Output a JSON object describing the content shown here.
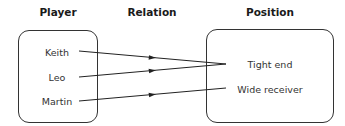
{
  "headers": {
    "domain": "Player",
    "relation": "Relation",
    "range": "Position"
  },
  "domain_items": [
    "Keith",
    "Leo",
    "Martin"
  ],
  "range_items": [
    "Tight end",
    "Wide receiver"
  ],
  "mappings": [
    {
      "from": "Keith",
      "to": "Tight end"
    },
    {
      "from": "Leo",
      "to": "Tight end"
    },
    {
      "from": "Martin",
      "to": "Wide receiver"
    }
  ]
}
